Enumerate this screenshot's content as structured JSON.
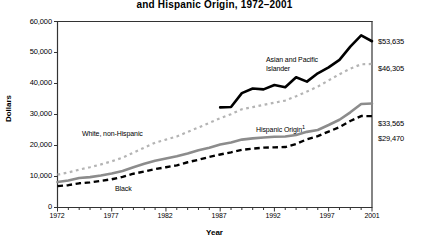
{
  "chart_data": {
    "type": "line",
    "title": "and Hispanic Origin, 1972–2001",
    "xlabel": "Year",
    "ylabel": "Dollars",
    "xlim": [
      1972,
      2001
    ],
    "ylim": [
      0,
      60000
    ],
    "grid": false,
    "legend_position": "inline-annotations",
    "ytick_labels": [
      "60,000",
      "50,000",
      "40,000",
      "30,000",
      "20,000",
      "10,000",
      "0"
    ],
    "ytick_values": [
      60000,
      50000,
      40000,
      30000,
      20000,
      10000,
      0
    ],
    "xtick_labels": [
      "1972",
      "1977",
      "1982",
      "1987",
      "1992",
      "1997",
      "2001"
    ],
    "xtick_values": [
      1972,
      1977,
      1982,
      1987,
      1992,
      1997,
      2001
    ],
    "x": [
      1972,
      1973,
      1974,
      1975,
      1976,
      1977,
      1978,
      1979,
      1980,
      1981,
      1982,
      1983,
      1984,
      1985,
      1986,
      1987,
      1988,
      1989,
      1990,
      1991,
      1992,
      1993,
      1994,
      1995,
      1996,
      1997,
      1998,
      1999,
      2000,
      2001
    ],
    "series": [
      {
        "name": "Asian and Pacific Islander",
        "label": "Asian and Pacific Islander",
        "style": "solid",
        "color": "#000000",
        "width": 2.6,
        "x": [
          1987,
          1988,
          1989,
          1990,
          1991,
          1992,
          1993,
          1994,
          1995,
          1996,
          1997,
          1998,
          1999,
          2000,
          2001
        ],
        "values": [
          32300,
          32400,
          36900,
          38400,
          38100,
          39500,
          38800,
          42000,
          40600,
          43300,
          45200,
          47600,
          51900,
          55500,
          53635
        ],
        "end_label": "$53,635",
        "end_value": 53635
      },
      {
        "name": "White, non-Hispanic",
        "label": "White, non-Hispanic",
        "style": "dotted",
        "color": "#b4b4b4",
        "width": 2.2,
        "x": [
          1972,
          1973,
          1974,
          1975,
          1976,
          1977,
          1978,
          1979,
          1980,
          1981,
          1982,
          1983,
          1984,
          1985,
          1986,
          1987,
          1988,
          1989,
          1990,
          1991,
          1992,
          1993,
          1994,
          1995,
          1996,
          1997,
          1998,
          1999,
          2000,
          2001
        ],
        "values": [
          10600,
          11300,
          12200,
          13000,
          13900,
          14900,
          16100,
          17700,
          19300,
          20900,
          21900,
          22900,
          24400,
          25800,
          27300,
          28800,
          30100,
          31700,
          32400,
          33100,
          33800,
          34500,
          35900,
          37400,
          39000,
          41000,
          43000,
          44800,
          46200,
          46305
        ],
        "end_label": "$46,305",
        "end_value": 46305
      },
      {
        "name": "Hispanic Origin",
        "label": "Hispanic Origin",
        "label_footnote": "1",
        "style": "solid",
        "color": "#8c8c8c",
        "width": 2.6,
        "x": [
          1972,
          1973,
          1974,
          1975,
          1976,
          1977,
          1978,
          1979,
          1980,
          1981,
          1982,
          1983,
          1984,
          1985,
          1986,
          1987,
          1988,
          1989,
          1990,
          1991,
          1992,
          1993,
          1994,
          1995,
          1996,
          1997,
          1998,
          1999,
          2000,
          2001
        ],
        "values": [
          8200,
          8700,
          9500,
          9800,
          10300,
          11000,
          11800,
          13000,
          14100,
          15100,
          15800,
          16500,
          17400,
          18500,
          19300,
          20300,
          21000,
          21900,
          22300,
          22600,
          22800,
          22900,
          23400,
          24400,
          25000,
          26600,
          28300,
          30700,
          33400,
          33565
        ],
        "end_label": "$33,565",
        "end_value": 33565
      },
      {
        "name": "Black",
        "label": "Black",
        "style": "dashed",
        "color": "#000000",
        "width": 2.4,
        "x": [
          1972,
          1973,
          1974,
          1975,
          1976,
          1977,
          1978,
          1979,
          1980,
          1981,
          1982,
          1983,
          1984,
          1985,
          1986,
          1987,
          1988,
          1989,
          1990,
          1991,
          1992,
          1993,
          1994,
          1995,
          1996,
          1997,
          1998,
          1999,
          2000,
          2001
        ],
        "values": [
          6900,
          7200,
          7800,
          8100,
          8600,
          9100,
          9900,
          10900,
          11600,
          12400,
          13000,
          13600,
          14600,
          15400,
          16300,
          17100,
          17800,
          18600,
          19000,
          19300,
          19400,
          19500,
          20500,
          22000,
          23000,
          24500,
          25900,
          27900,
          29500,
          29470
        ],
        "end_label": "$29,470",
        "end_value": 29470
      }
    ],
    "annotations": [
      {
        "text": "Asian and Pacific",
        "text2": "Islander",
        "for": "Asian and Pacific Islander"
      },
      {
        "text": "White, non-Hispanic",
        "for": "White, non-Hispanic"
      },
      {
        "text": "Hispanic Origin",
        "footnote": "1",
        "for": "Hispanic Origin"
      },
      {
        "text": "Black",
        "for": "Black"
      }
    ]
  }
}
